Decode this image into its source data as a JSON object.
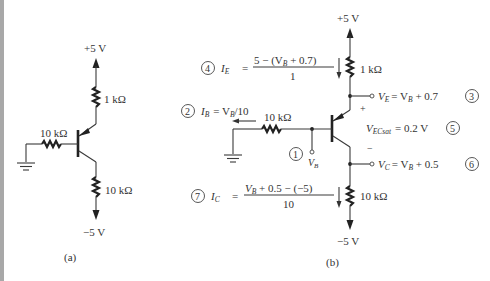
{
  "figure_a": {
    "caption": "(a)",
    "supply_pos": "+5 V",
    "supply_neg": "−5 V",
    "r_emitter": "1 kΩ",
    "r_base": "10 kΩ",
    "r_collector": "10 kΩ"
  },
  "figure_b": {
    "caption": "(b)",
    "supply_pos": "+5 V",
    "supply_neg": "−5 V",
    "r_emitter": "1 kΩ",
    "r_base": "10 kΩ",
    "r_collector": "10 kΩ",
    "vb_label": "V",
    "vb_sub": "B",
    "plus_sign": "+",
    "minus_sign": "−",
    "steps": [
      {
        "num": "1",
        "text": "V_B node"
      },
      {
        "num": "2",
        "lhs": "I",
        "lhs_sub": "B",
        "rhs": "= V",
        "rhs_sub": "B",
        "rhs_tail": "/10"
      },
      {
        "num": "3",
        "lhs": "V",
        "lhs_sub": "E",
        "rhs": "= V",
        "rhs_sub": "B",
        "rhs_tail": " + 0.7"
      },
      {
        "num": "4",
        "lhs": "I",
        "lhs_sub": "E",
        "eq": "=",
        "numer_a": "5 − (V",
        "numer_sub": "B",
        "numer_b": " + 0.7)",
        "denom": "1"
      },
      {
        "num": "5",
        "lhs": "V",
        "lhs_sub": "ECsat",
        "rhs": "= 0.2 V"
      },
      {
        "num": "6",
        "lhs": "V",
        "lhs_sub": "C",
        "rhs": "= V",
        "rhs_sub": "B",
        "rhs_tail": " + 0.5"
      },
      {
        "num": "7",
        "lhs": "I",
        "lhs_sub": "C",
        "eq": "=",
        "numer_a": "V",
        "numer_sub": "B",
        "numer_b": " + 0.5 − (−5)",
        "denom": "10"
      }
    ]
  }
}
